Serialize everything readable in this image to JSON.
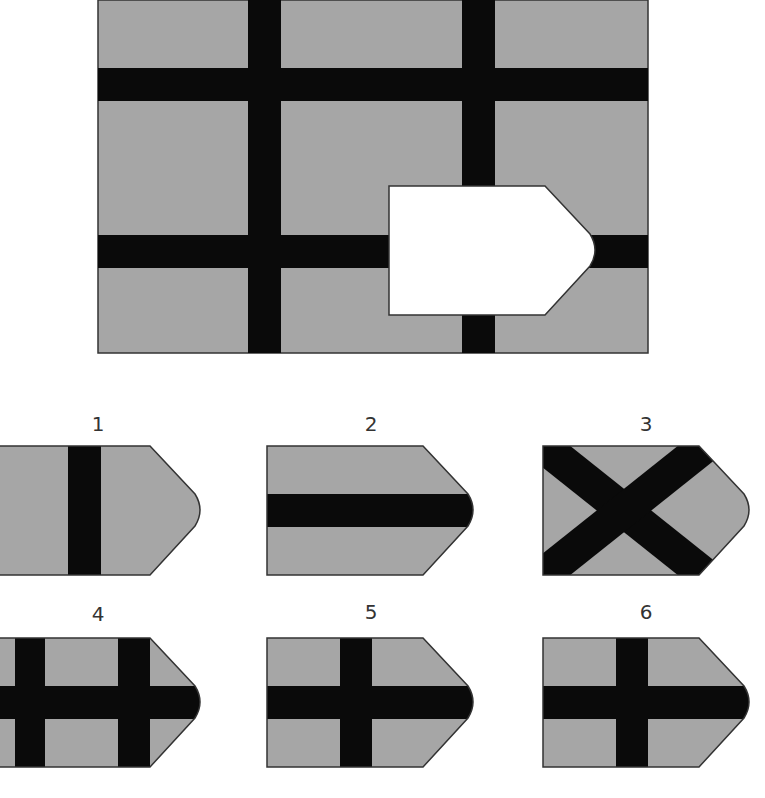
{
  "puzzle": {
    "description": "Grid pattern with a missing pentagonal piece; choose the option that fits",
    "colors": {
      "fill": "#a6a6a6",
      "bar": "#0a0a0a",
      "missing": "#ffffff",
      "outline": "#333333"
    }
  },
  "options": [
    {
      "label": "1",
      "pattern": "single vertical bar"
    },
    {
      "label": "2",
      "pattern": "single horizontal bar"
    },
    {
      "label": "3",
      "pattern": "diagonal X"
    },
    {
      "label": "4",
      "pattern": "two vertical bars plus horizontal bar"
    },
    {
      "label": "5",
      "pattern": "cross, vertical bar left of center"
    },
    {
      "label": "6",
      "pattern": "cross, vertical bar near center"
    }
  ]
}
